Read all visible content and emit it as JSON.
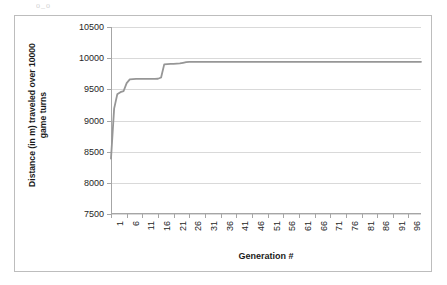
{
  "artifact": {
    "text": "o_o"
  },
  "chart_data": {
    "type": "line",
    "title": "",
    "subtitle": "",
    "xlabel": "Generation #",
    "ylabel": "Distance (in m) traveled over 10000 game turns",
    "ylabel_line1": "Distance (in m) traveled over 10000",
    "ylabel_line2": "game turns",
    "ylim": [
      7500,
      10500
    ],
    "ytick_step": 500,
    "ytick_labels": [
      "10500",
      "10000",
      "9500",
      "9000",
      "8500",
      "8000",
      "7500"
    ],
    "ytick_values": [
      10500,
      10000,
      9500,
      9000,
      8500,
      8000,
      7500
    ],
    "xlim": [
      1,
      100
    ],
    "xtick_labels": [
      "1",
      "6",
      "11",
      "16",
      "21",
      "26",
      "31",
      "36",
      "41",
      "46",
      "51",
      "56",
      "61",
      "66",
      "71",
      "76",
      "81",
      "86",
      "91",
      "96"
    ],
    "xtick_values": [
      1,
      6,
      11,
      16,
      21,
      26,
      31,
      36,
      41,
      46,
      51,
      56,
      61,
      66,
      71,
      76,
      81,
      86,
      91,
      96
    ],
    "grid": "horizontal",
    "legend": "none",
    "series": [
      {
        "name": "Best distance",
        "color": "#969696",
        "x": [
          1,
          2,
          3,
          4,
          5,
          6,
          7,
          8,
          9,
          10,
          11,
          12,
          13,
          14,
          15,
          16,
          17,
          18,
          19,
          20,
          21,
          22,
          23,
          24,
          25,
          26,
          27,
          28,
          29,
          30,
          31,
          32,
          33,
          34,
          35,
          36,
          37,
          38,
          39,
          40,
          41,
          42,
          43,
          44,
          45,
          46,
          47,
          48,
          49,
          50,
          51,
          52,
          53,
          54,
          55,
          56,
          57,
          58,
          59,
          60,
          61,
          62,
          63,
          64,
          65,
          66,
          67,
          68,
          69,
          70,
          71,
          72,
          73,
          74,
          75,
          76,
          77,
          78,
          79,
          80,
          81,
          82,
          83,
          84,
          85,
          86,
          87,
          88,
          89,
          90,
          91,
          92,
          93,
          94,
          95,
          96,
          97,
          98,
          99,
          100
        ],
        "values": [
          8390,
          9190,
          9420,
          9455,
          9470,
          9600,
          9660,
          9665,
          9668,
          9668,
          9668,
          9668,
          9668,
          9668,
          9668,
          9670,
          9690,
          9900,
          9905,
          9908,
          9910,
          9912,
          9915,
          9925,
          9935,
          9940,
          9941,
          9941,
          9941,
          9942,
          9942,
          9942,
          9942,
          9942,
          9942,
          9942,
          9942,
          9942,
          9942,
          9942,
          9942,
          9942,
          9942,
          9942,
          9942,
          9942,
          9942,
          9942,
          9942,
          9942,
          9942,
          9942,
          9942,
          9942,
          9942,
          9942,
          9942,
          9942,
          9942,
          9942,
          9942,
          9942,
          9942,
          9942,
          9942,
          9942,
          9942,
          9942,
          9942,
          9942,
          9942,
          9942,
          9942,
          9942,
          9942,
          9942,
          9942,
          9942,
          9942,
          9942,
          9942,
          9942,
          9942,
          9942,
          9942,
          9942,
          9942,
          9942,
          9942,
          9942,
          9942,
          9942,
          9942,
          9942,
          9942,
          9942,
          9942,
          9942,
          9942,
          9942
        ]
      }
    ]
  }
}
